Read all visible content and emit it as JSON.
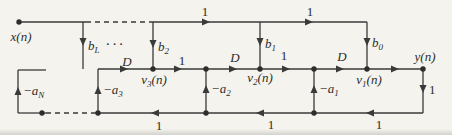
{
  "figure": {
    "type": "signal-flow-graph",
    "background_color": "#f4f3ee",
    "line_color": "#3a3a3a",
    "text_color": "#2e2d2b"
  },
  "labels": {
    "input": {
      "pre": "x(n)"
    },
    "output": {
      "pre": "y(n)"
    },
    "ellipsis": "···",
    "delay": "D",
    "one": "1",
    "b_L": {
      "pre": "b",
      "sub": "L"
    },
    "b_2": {
      "pre": "b",
      "sub": "2"
    },
    "b_1": {
      "pre": "b",
      "sub": "1"
    },
    "b_0": {
      "pre": "b",
      "sub": "0"
    },
    "a_N": {
      "pre": "−a",
      "sub": "N"
    },
    "a_3": {
      "pre": "−a",
      "sub": "3"
    },
    "a_2": {
      "pre": "−a",
      "sub": "2"
    },
    "a_1": {
      "pre": "−a",
      "sub": "1"
    },
    "v_3": {
      "pre": "v",
      "sub": "3",
      "post": "(n)"
    },
    "v_2": {
      "pre": "v",
      "sub": "2",
      "post": "(n)"
    },
    "v_1": {
      "pre": "v",
      "sub": "1",
      "post": "(n)"
    }
  }
}
